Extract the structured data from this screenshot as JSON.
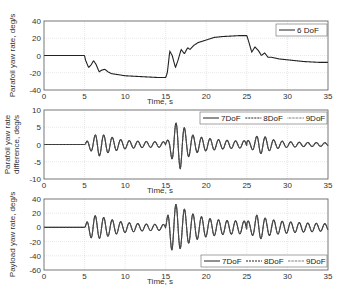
{
  "chart_data": [
    {
      "type": "line",
      "title": "",
      "xlabel": "Time, s",
      "ylabel": "Parafoil yaw rate, deg/s",
      "xlim": [
        0,
        35
      ],
      "ylim": [
        -40,
        40
      ],
      "xticks": [
        0,
        5,
        10,
        15,
        20,
        25,
        30,
        35
      ],
      "yticks": [
        -40,
        -20,
        0,
        20,
        40
      ],
      "grid": true,
      "legend_position": "upper right",
      "series": [
        {
          "name": "6 DoF",
          "style": "solid",
          "x": [
            0,
            5,
            5.1,
            5.5,
            5.8,
            6.1,
            6.4,
            6.8,
            7.1,
            7.5,
            7.9,
            8.3,
            9,
            10,
            11,
            12,
            13,
            14,
            15,
            15.2,
            15.5,
            15.8,
            16.2,
            16.5,
            16.9,
            17.3,
            17.7,
            18,
            18.5,
            19,
            20,
            21,
            22,
            23,
            24,
            25,
            25.2,
            25.6,
            26,
            26.4,
            26.8,
            27.2,
            27.6,
            28,
            29,
            30,
            31,
            32,
            33,
            34,
            35
          ],
          "values": [
            0,
            0,
            -5,
            -14,
            -11,
            -6,
            -10,
            -19,
            -17,
            -16,
            -19,
            -21,
            -22,
            -23.5,
            -24,
            -24.5,
            -25,
            -25.5,
            -25.5,
            -20,
            5,
            0,
            -14,
            -6,
            7,
            2,
            9,
            7,
            12,
            15,
            18,
            21,
            22,
            22.5,
            23,
            23,
            17,
            4,
            10,
            6,
            0,
            3,
            -2,
            -2,
            -4,
            -5,
            -6,
            -7,
            -7.5,
            -8,
            -8
          ]
        }
      ]
    },
    {
      "type": "line",
      "title": "",
      "xlabel": "Time, s",
      "ylabel": "Parafoil yaw rate difference, deg/s",
      "xlim": [
        0,
        35
      ],
      "ylim": [
        -10,
        10
      ],
      "xticks": [
        0,
        5,
        10,
        15,
        20,
        25,
        30,
        35
      ],
      "yticks": [
        -10,
        -5,
        0,
        5,
        10
      ],
      "grid": true,
      "legend_position": "upper right",
      "oscillation_period_s": 1.05,
      "envelope": {
        "t": [
          0,
          5,
          5.3,
          6,
          6.7,
          7.5,
          8.5,
          9.5,
          10.5,
          12,
          13.5,
          15,
          15.4,
          16,
          16.8,
          17.5,
          18.5,
          20,
          22,
          24,
          25.5,
          26.5,
          27.5,
          28.5,
          30,
          32,
          35
        ],
        "amp": [
          0,
          0,
          1.0,
          2.2,
          3.4,
          2.6,
          2.0,
          1.4,
          1.1,
          0.9,
          0.8,
          0.8,
          1.6,
          5.8,
          7.0,
          4.0,
          2.5,
          1.8,
          1.3,
          1.0,
          1.2,
          2.8,
          2.0,
          1.2,
          0.8,
          0.6,
          0.5
        ]
      },
      "series": [
        {
          "name": "7DoF",
          "style": "solid"
        },
        {
          "name": "8DoF",
          "style": "dashed"
        },
        {
          "name": "9DoF",
          "style": "dotted"
        }
      ]
    },
    {
      "type": "line",
      "title": "",
      "xlabel": "Time, s",
      "ylabel": "Payload yaw rate, deg/s",
      "xlim": [
        0,
        35
      ],
      "ylim": [
        -60,
        40
      ],
      "xticks": [
        0,
        5,
        10,
        15,
        20,
        25,
        30,
        35
      ],
      "yticks": [
        -60,
        -40,
        -20,
        0,
        20,
        40
      ],
      "grid": true,
      "legend_position": "lower right",
      "oscillation_period_s": 1.05,
      "envelope": {
        "t": [
          0,
          5,
          5.3,
          6,
          7,
          8,
          9,
          10,
          11,
          12,
          13,
          15,
          15.3,
          15.8,
          16.5,
          17.5,
          18.5,
          20,
          22,
          24,
          25.5,
          26.3,
          27.5,
          29,
          31,
          33,
          35
        ],
        "amp": [
          0,
          0,
          8,
          17,
          15,
          12,
          9,
          7,
          6,
          5,
          4.5,
          4,
          20,
          33,
          32,
          24,
          18,
          13,
          10,
          9,
          9,
          18,
          12,
          9,
          7,
          6,
          5
        ]
      },
      "series": [
        {
          "name": "7DoF",
          "style": "solid"
        },
        {
          "name": "8DoF",
          "style": "dashed"
        },
        {
          "name": "9DoF",
          "style": "dotted"
        }
      ]
    }
  ],
  "plots": [
    {
      "ylabel_lines": [
        "Parafoil yaw rate, deg/s"
      ],
      "xlabel": "Time, s",
      "legend": [
        "6 DoF"
      ]
    },
    {
      "ylabel_lines": [
        "Parafoil yaw rate",
        "difference, deg/s"
      ],
      "xlabel": "Time, s",
      "legend": [
        "7DoF",
        "8DoF",
        "9DoF"
      ]
    },
    {
      "ylabel_lines": [
        "Payload yaw rate, deg/s"
      ],
      "xlabel": "Time, s",
      "legend": [
        "7DoF",
        "8DoF",
        "9DoF"
      ]
    }
  ]
}
